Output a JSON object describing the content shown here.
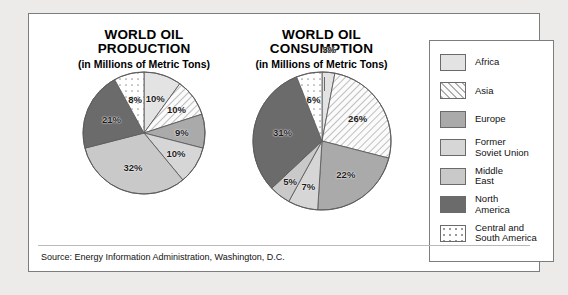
{
  "panel": {
    "source": "Source: Energy Information Administration, Washington, D.C."
  },
  "charts": [
    {
      "id": "production",
      "title_line1": "WORLD OIL",
      "title_line2": "PRODUCTION",
      "subtitle": "(in Millions of Metric Tons)"
    },
    {
      "id": "consumption",
      "title_line1": "WORLD OIL",
      "title_line2": "CONSUMPTION",
      "subtitle": "(in Millions of Metric Tons)"
    }
  ],
  "legend": {
    "items": [
      {
        "label": "Africa",
        "fill": "#e3e3e3",
        "pattern": "solid"
      },
      {
        "label": "Asia",
        "fill": "#f2f2f2",
        "pattern": "hatch"
      },
      {
        "label": "Europe",
        "fill": "#aaaaaa",
        "pattern": "solid"
      },
      {
        "label": "Former\nSoviet Union",
        "fill": "#d6d6d6",
        "pattern": "solid"
      },
      {
        "label": "Middle\nEast",
        "fill": "#c9c9c9",
        "pattern": "solid"
      },
      {
        "label": "North\nAmerica",
        "fill": "#6b6b6b",
        "pattern": "solid"
      },
      {
        "label": "Central and\nSouth America",
        "fill": "#ffffff",
        "pattern": "dots"
      }
    ]
  },
  "chart_data": [
    {
      "type": "pie",
      "title": "WORLD OIL PRODUCTION",
      "subtitle": "(in Millions of Metric Tons)",
      "unit": "percent",
      "categories": [
        "Africa",
        "Asia",
        "Europe",
        "Former Soviet Union",
        "Middle East",
        "North America",
        "Central and South America"
      ],
      "values": [
        10,
        10,
        9,
        10,
        32,
        21,
        8
      ],
      "labels": [
        "10%",
        "10%",
        "9%",
        "10%",
        "32%",
        "21%",
        "8%"
      ],
      "colors": [
        "#e3e3e3",
        "#f2f2f2",
        "#aaaaaa",
        "#d6d6d6",
        "#c9c9c9",
        "#6b6b6b",
        "#ffffff"
      ],
      "patterns": [
        "solid",
        "hatch",
        "solid",
        "solid",
        "solid",
        "solid",
        "dots"
      ],
      "start_angle_deg": 0,
      "direction": "clockwise",
      "legend_position": "right"
    },
    {
      "type": "pie",
      "title": "WORLD OIL CONSUMPTION",
      "subtitle": "(in Millions of Metric Tons)",
      "unit": "percent",
      "categories": [
        "Africa",
        "Asia",
        "Europe",
        "Former Soviet Union",
        "Middle East",
        "North America",
        "Central and South America"
      ],
      "values": [
        3,
        26,
        22,
        7,
        5,
        31,
        6
      ],
      "labels": [
        "3%",
        "26%",
        "22%",
        "7%",
        "5%",
        "31%",
        "6%"
      ],
      "colors": [
        "#e3e3e3",
        "#f2f2f2",
        "#aaaaaa",
        "#d6d6d6",
        "#c9c9c9",
        "#6b6b6b",
        "#ffffff"
      ],
      "patterns": [
        "solid",
        "hatch",
        "solid",
        "solid",
        "solid",
        "solid",
        "dots"
      ],
      "start_angle_deg": 0,
      "direction": "clockwise",
      "legend_position": "right",
      "annotations": [
        {
          "text": "3%",
          "leader_line": true,
          "target": "Africa"
        }
      ]
    }
  ]
}
